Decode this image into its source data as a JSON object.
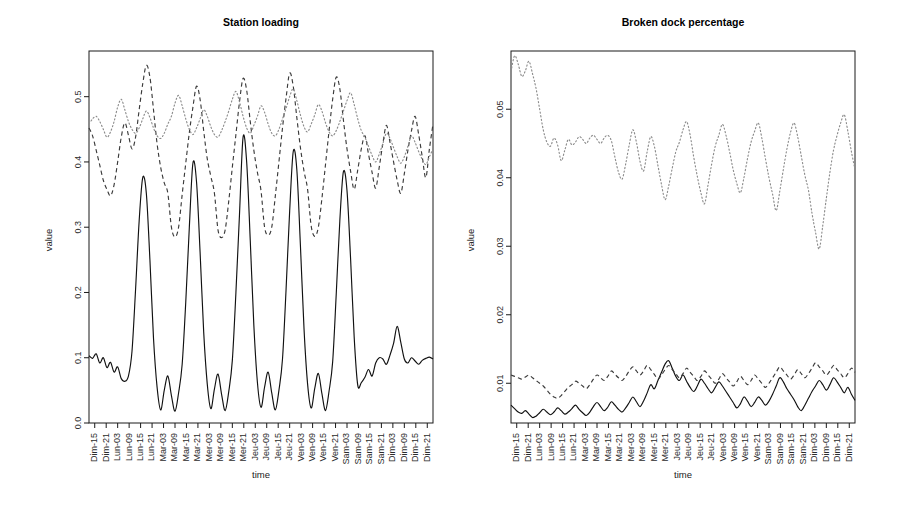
{
  "figure": {
    "width": 899,
    "height": 506,
    "background": "#ffffff",
    "panels": 2
  },
  "panels": [
    {
      "id": "station-loading",
      "title": "Station loading",
      "ylabel": "value",
      "xlabel": "time"
    },
    {
      "id": "broken-dock-percentage",
      "title": "Broken dock percentage",
      "ylabel": "value",
      "xlabel": "time"
    }
  ],
  "x_tick_labels": [
    "Dim-15",
    "Dim-21",
    "Lun-03",
    "Lun-09",
    "Lun-15",
    "Lun-21",
    "Mar-03",
    "Mar-09",
    "Mar-15",
    "Mar-21",
    "Mer-03",
    "Mer-09",
    "Mer-15",
    "Mer-21",
    "Jeu-03",
    "Jeu-09",
    "Jeu-15",
    "Jeu-21",
    "Ven-03",
    "Ven-09",
    "Ven-15",
    "Ven-21",
    "Sam-03",
    "Sam-09",
    "Sam-15",
    "Sam-21",
    "Dim-03",
    "Dim-09",
    "Dim-15",
    "Dim-21"
  ],
  "chart_data": [
    {
      "type": "line",
      "title": "Station loading",
      "xlabel": "time",
      "ylabel": "value",
      "grid": false,
      "legend": "none",
      "ylim": [
        0.0,
        0.57
      ],
      "yticks": [
        0.0,
        0.1,
        0.2,
        0.3,
        0.4,
        0.5
      ],
      "ytick_labels": [
        "0.0",
        "0.1",
        "0.2",
        "0.3",
        "0.4",
        "0.5"
      ],
      "xtick_labels": [
        "Dim-15",
        "Dim-21",
        "Lun-03",
        "Lun-09",
        "Lun-15",
        "Lun-21",
        "Mar-03",
        "Mar-09",
        "Mar-15",
        "Mar-21",
        "Mer-03",
        "Mer-09",
        "Mer-15",
        "Mer-21",
        "Jeu-03",
        "Jeu-09",
        "Jeu-15",
        "Jeu-21",
        "Ven-03",
        "Ven-09",
        "Ven-15",
        "Ven-21",
        "Sam-03",
        "Sam-09",
        "Sam-15",
        "Sam-21",
        "Dim-03",
        "Dim-09",
        "Dim-15",
        "Dim-21"
      ],
      "series": [
        {
          "name": "solid",
          "style": "solid",
          "color": "#111111",
          "values": [
            0.103,
            0.099,
            0.106,
            0.092,
            0.1,
            0.085,
            0.093,
            0.078,
            0.086,
            0.068,
            0.064,
            0.072,
            0.11,
            0.205,
            0.31,
            0.376,
            0.352,
            0.25,
            0.13,
            0.055,
            0.02,
            0.05,
            0.072,
            0.042,
            0.018,
            0.046,
            0.09,
            0.185,
            0.3,
            0.398,
            0.37,
            0.262,
            0.14,
            0.06,
            0.022,
            0.052,
            0.075,
            0.044,
            0.019,
            0.048,
            0.096,
            0.2,
            0.32,
            0.438,
            0.4,
            0.28,
            0.15,
            0.062,
            0.024,
            0.055,
            0.078,
            0.046,
            0.02,
            0.05,
            0.098,
            0.205,
            0.325,
            0.416,
            0.388,
            0.272,
            0.145,
            0.06,
            0.023,
            0.053,
            0.076,
            0.045,
            0.019,
            0.049,
            0.094,
            0.198,
            0.31,
            0.385,
            0.356,
            0.252,
            0.132,
            0.058,
            0.062,
            0.07,
            0.082,
            0.072,
            0.092,
            0.1,
            0.098,
            0.09,
            0.104,
            0.122,
            0.148,
            0.124,
            0.098,
            0.092,
            0.1,
            0.095,
            0.09,
            0.096,
            0.099,
            0.101,
            0.098
          ]
        },
        {
          "name": "dashed",
          "style": "dashed",
          "color": "#3b3b3b",
          "values": [
            0.452,
            0.44,
            0.418,
            0.395,
            0.372,
            0.358,
            0.348,
            0.365,
            0.4,
            0.438,
            0.46,
            0.441,
            0.42,
            0.438,
            0.48,
            0.52,
            0.548,
            0.53,
            0.48,
            0.428,
            0.392,
            0.368,
            0.352,
            0.3,
            0.285,
            0.3,
            0.35,
            0.398,
            0.445,
            0.484,
            0.516,
            0.496,
            0.448,
            0.405,
            0.378,
            0.352,
            0.296,
            0.284,
            0.296,
            0.34,
            0.392,
            0.442,
            0.492,
            0.528,
            0.51,
            0.462,
            0.418,
            0.384,
            0.356,
            0.3,
            0.288,
            0.3,
            0.348,
            0.4,
            0.452,
            0.498,
            0.536,
            0.516,
            0.468,
            0.422,
            0.386,
            0.358,
            0.302,
            0.286,
            0.3,
            0.344,
            0.396,
            0.448,
            0.496,
            0.53,
            0.512,
            0.464,
            0.42,
            0.386,
            0.358,
            0.388,
            0.42,
            0.44,
            0.412,
            0.384,
            0.36,
            0.392,
            0.428,
            0.456,
            0.43,
            0.4,
            0.372,
            0.352,
            0.382,
            0.418,
            0.448,
            0.47,
            0.442,
            0.408,
            0.376,
            0.42,
            0.458
          ]
        },
        {
          "name": "dotted",
          "style": "dotted",
          "color": "#8c8c8c",
          "values": [
            0.458,
            0.466,
            0.47,
            0.462,
            0.45,
            0.438,
            0.446,
            0.462,
            0.484,
            0.496,
            0.48,
            0.462,
            0.45,
            0.444,
            0.452,
            0.466,
            0.478,
            0.468,
            0.452,
            0.44,
            0.436,
            0.444,
            0.458,
            0.47,
            0.49,
            0.502,
            0.486,
            0.466,
            0.45,
            0.442,
            0.452,
            0.466,
            0.48,
            0.47,
            0.454,
            0.442,
            0.438,
            0.448,
            0.462,
            0.478,
            0.496,
            0.508,
            0.492,
            0.47,
            0.452,
            0.444,
            0.456,
            0.47,
            0.486,
            0.476,
            0.458,
            0.444,
            0.44,
            0.45,
            0.466,
            0.482,
            0.5,
            0.512,
            0.494,
            0.472,
            0.454,
            0.446,
            0.458,
            0.472,
            0.488,
            0.478,
            0.46,
            0.446,
            0.44,
            0.448,
            0.462,
            0.478,
            0.494,
            0.506,
            0.488,
            0.466,
            0.448,
            0.438,
            0.424,
            0.41,
            0.4,
            0.412,
            0.428,
            0.444,
            0.436,
            0.422,
            0.408,
            0.398,
            0.408,
            0.424,
            0.44,
            0.43,
            0.416,
            0.404,
            0.396,
            0.408,
            0.42
          ]
        }
      ]
    },
    {
      "type": "line",
      "title": "Broken dock percentage",
      "xlabel": "time",
      "ylabel": "value",
      "grid": false,
      "legend": "none",
      "ylim": [
        0.0042,
        0.0585
      ],
      "yticks": [
        0.01,
        0.02,
        0.03,
        0.04,
        0.05
      ],
      "ytick_labels": [
        "0.01",
        "0.02",
        "0.03",
        "0.04",
        "0.05"
      ],
      "xtick_labels": [
        "Dim-15",
        "Dim-21",
        "Lun-03",
        "Lun-09",
        "Lun-15",
        "Lun-21",
        "Mar-03",
        "Mar-09",
        "Mar-15",
        "Mar-21",
        "Mer-03",
        "Mer-09",
        "Mer-15",
        "Mer-21",
        "Jeu-03",
        "Jeu-09",
        "Jeu-15",
        "Jeu-21",
        "Ven-03",
        "Ven-09",
        "Ven-15",
        "Ven-21",
        "Sam-03",
        "Sam-09",
        "Sam-15",
        "Sam-21",
        "Dim-03",
        "Dim-09",
        "Dim-15",
        "Dim-21"
      ],
      "series": [
        {
          "name": "solid",
          "style": "solid",
          "color": "#111111",
          "values": [
            0.0068,
            0.0063,
            0.0058,
            0.0056,
            0.006,
            0.0055,
            0.005,
            0.0052,
            0.0057,
            0.0062,
            0.0058,
            0.0054,
            0.0058,
            0.0064,
            0.006,
            0.0055,
            0.0058,
            0.0063,
            0.0068,
            0.0062,
            0.0057,
            0.0053,
            0.0058,
            0.0066,
            0.0072,
            0.0066,
            0.006,
            0.0065,
            0.0073,
            0.0068,
            0.0062,
            0.0058,
            0.0064,
            0.0072,
            0.008,
            0.0073,
            0.0066,
            0.0074,
            0.0086,
            0.0098,
            0.0092,
            0.0104,
            0.0116,
            0.0128,
            0.0133,
            0.0122,
            0.011,
            0.0104,
            0.0112,
            0.0103,
            0.0094,
            0.0088,
            0.0096,
            0.0106,
            0.01,
            0.0092,
            0.0086,
            0.0094,
            0.0102,
            0.0096,
            0.0088,
            0.008,
            0.0072,
            0.0064,
            0.007,
            0.008,
            0.0074,
            0.0066,
            0.0072,
            0.008,
            0.0075,
            0.0068,
            0.0074,
            0.0084,
            0.0096,
            0.0108,
            0.0102,
            0.0092,
            0.0084,
            0.0076,
            0.0066,
            0.006,
            0.0068,
            0.0078,
            0.0088,
            0.0096,
            0.0104,
            0.0098,
            0.009,
            0.0098,
            0.0108,
            0.0102,
            0.0094,
            0.0086,
            0.0094,
            0.0084,
            0.0075
          ]
        },
        {
          "name": "dashed",
          "style": "dashed",
          "color": "#3b3b3b",
          "values": [
            0.0112,
            0.011,
            0.0108,
            0.0106,
            0.0109,
            0.0112,
            0.0108,
            0.0104,
            0.01,
            0.0096,
            0.009,
            0.0084,
            0.008,
            0.0078,
            0.0082,
            0.0088,
            0.0094,
            0.0098,
            0.0103,
            0.01,
            0.0096,
            0.0092,
            0.0098,
            0.0106,
            0.0112,
            0.0108,
            0.0104,
            0.011,
            0.0118,
            0.0113,
            0.0108,
            0.0104,
            0.011,
            0.0118,
            0.0124,
            0.0118,
            0.0112,
            0.0118,
            0.0126,
            0.012,
            0.0113,
            0.0106,
            0.0112,
            0.012,
            0.0126,
            0.012,
            0.0114,
            0.0108,
            0.0114,
            0.0122,
            0.0116,
            0.011,
            0.0104,
            0.011,
            0.0118,
            0.0112,
            0.0106,
            0.01,
            0.0106,
            0.0114,
            0.0108,
            0.0102,
            0.0096,
            0.0102,
            0.011,
            0.0104,
            0.0098,
            0.0104,
            0.0112,
            0.0106,
            0.01,
            0.0094,
            0.01,
            0.0108,
            0.0116,
            0.0124,
            0.0118,
            0.0112,
            0.0106,
            0.0112,
            0.012,
            0.0114,
            0.0108,
            0.0114,
            0.0122,
            0.013,
            0.0124,
            0.0118,
            0.0112,
            0.0118,
            0.0126,
            0.012,
            0.0114,
            0.0108,
            0.0114,
            0.0122,
            0.0116
          ]
        },
        {
          "name": "dotted",
          "style": "dotted",
          "color": "#8c8c8c",
          "values": [
            0.0555,
            0.0578,
            0.0566,
            0.0548,
            0.0556,
            0.057,
            0.0552,
            0.053,
            0.05,
            0.047,
            0.0452,
            0.0446,
            0.0458,
            0.0448,
            0.0425,
            0.044,
            0.0456,
            0.0448,
            0.0452,
            0.046,
            0.0456,
            0.045,
            0.0458,
            0.0462,
            0.0456,
            0.045,
            0.0458,
            0.0462,
            0.0454,
            0.043,
            0.0408,
            0.0398,
            0.042,
            0.0448,
            0.047,
            0.0452,
            0.0424,
            0.041,
            0.0438,
            0.046,
            0.0446,
            0.0418,
            0.039,
            0.0368,
            0.0388,
            0.0414,
            0.0438,
            0.0452,
            0.047,
            0.0482,
            0.0462,
            0.043,
            0.0402,
            0.0378,
            0.0362,
            0.039,
            0.042,
            0.0446,
            0.0462,
            0.0478,
            0.0462,
            0.0438,
            0.0412,
            0.0392,
            0.0378,
            0.04,
            0.0428,
            0.0452,
            0.0468,
            0.048,
            0.0458,
            0.0428,
            0.04,
            0.0376,
            0.0352,
            0.038,
            0.0412,
            0.0442,
            0.0466,
            0.048,
            0.046,
            0.0432,
            0.0404,
            0.0382,
            0.0348,
            0.032,
            0.0296,
            0.033,
            0.037,
            0.0408,
            0.044,
            0.0462,
            0.048,
            0.0492,
            0.0468,
            0.0438,
            0.0412
          ]
        }
      ]
    }
  ]
}
